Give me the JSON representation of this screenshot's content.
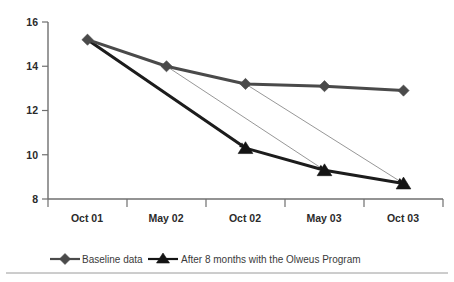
{
  "chart_data": {
    "type": "line",
    "title": "",
    "subtitle": "",
    "xlabel": "",
    "ylabel": "",
    "categories": [
      "Oct 01",
      "May 02",
      "Oct 02",
      "May 03",
      "Oct 03"
    ],
    "ylim": [
      8,
      16
    ],
    "yticks": [
      8,
      10,
      12,
      14,
      16
    ],
    "ytick_labels": [
      "8",
      "10",
      "12",
      "14",
      "16"
    ],
    "grid": false,
    "legend_position": "bottom",
    "series": [
      {
        "name": "Baseline data",
        "marker": "diamond",
        "color": "#4a4a4a",
        "x": [
          "Oct 01",
          "May 02",
          "Oct 02",
          "May 03",
          "Oct 03"
        ],
        "values": [
          15.2,
          14.0,
          13.2,
          13.1,
          12.9
        ]
      },
      {
        "name": "After 8 months with the Olweus Program",
        "marker": "triangle",
        "color": "#141414",
        "x": [
          "Oct 01",
          "Oct 02",
          "May 03",
          "Oct 03"
        ],
        "values": [
          15.2,
          10.3,
          9.3,
          8.7
        ]
      }
    ],
    "connectors": [
      {
        "from": {
          "x": "Oct 01",
          "y": 15.2
        },
        "to": {
          "x": "Oct 02",
          "y": 10.3
        }
      },
      {
        "from": {
          "x": "May 02",
          "y": 14.0
        },
        "to": {
          "x": "May 03",
          "y": 9.3
        }
      },
      {
        "from": {
          "x": "Oct 02",
          "y": 13.2
        },
        "to": {
          "x": "Oct 03",
          "y": 8.7
        }
      }
    ],
    "annotations": []
  },
  "legend": {
    "entries": [
      {
        "label": "Baseline data",
        "marker": "diamond-marker-icon"
      },
      {
        "label": "After 8 months with the Olweus Program",
        "marker": "triangle-marker-icon"
      }
    ]
  },
  "axes": {
    "y_tick_labels": [
      "16",
      "14",
      "12",
      "10",
      "8"
    ],
    "x_tick_labels": [
      "Oct 01",
      "May 02",
      "Oct 02",
      "May 03",
      "Oct 03"
    ]
  },
  "colors": {
    "baseline": "#4a4a4a",
    "treatment": "#141414",
    "connector": "#8b8b8b",
    "axis": "#6f6f6f",
    "background": "#ffffff"
  }
}
